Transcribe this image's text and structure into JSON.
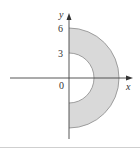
{
  "figure": {
    "axes": {
      "x_label": "x",
      "y_label": "y",
      "origin_label": "0"
    },
    "ticks": {
      "y_outer": "6",
      "y_inner": "3"
    },
    "region": {
      "description": "Right half of annulus between circles of radius 3 and 6, x ≥ 0",
      "inner_radius": 3,
      "outer_radius": 6,
      "fill_color": "#d9d9d9",
      "stroke_color": "#888888"
    },
    "axis_color": "#444444"
  }
}
